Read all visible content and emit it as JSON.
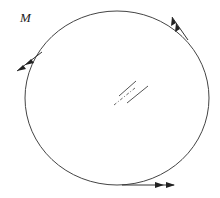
{
  "diagram": {
    "label": "M",
    "colors": {
      "line": "#444444",
      "arrow": "#222222",
      "background": "#ffffff"
    },
    "shape": {
      "type": "closed-curve",
      "center": [
        117,
        98
      ],
      "radii": [
        92,
        87
      ]
    },
    "vectors": [
      {
        "name": "velocity-vector-top-right",
        "direction": "up-left",
        "arrowheads": 2
      },
      {
        "name": "velocity-vector-left",
        "direction": "down-left",
        "arrowheads": 2
      },
      {
        "name": "velocity-vector-bottom",
        "direction": "right",
        "arrowheads": 2
      }
    ],
    "center_mark": {
      "type": "section-lines",
      "solid_lines": 2,
      "dash_dot_lines": 1
    }
  }
}
